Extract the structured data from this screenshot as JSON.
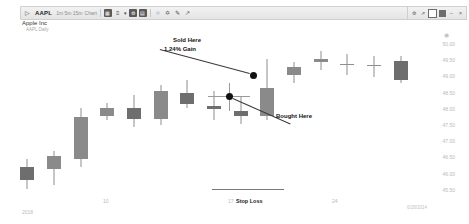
{
  "toolbar": {
    "symbol": "AAPL",
    "interval_label": "1m  5m  15m",
    "chart_type_label": "Chart",
    "caret": "▾",
    "icons": [
      {
        "name": "grid-icon",
        "glyph": "▦"
      },
      {
        "name": "indicator-icon",
        "glyph": "≡"
      },
      {
        "name": "chevron-down-icon",
        "glyph": "▾"
      },
      {
        "name": "settings-gear-icon",
        "glyph": "⚙"
      },
      {
        "name": "calendar-icon",
        "glyph": "▤"
      },
      {
        "name": "circle-tool-icon",
        "glyph": "○"
      },
      {
        "name": "trendline-tool-icon",
        "glyph": "╱"
      },
      {
        "name": "annotation-tool-icon",
        "glyph": "✐"
      },
      {
        "name": "cursor-tool-icon",
        "glyph": "↖"
      }
    ]
  },
  "window_controls": [
    {
      "name": "settings-icon",
      "glyph": "⚙"
    },
    {
      "name": "expand-icon",
      "glyph": "⤢"
    },
    {
      "name": "restore-icon",
      "glyph": "◻"
    },
    {
      "name": "maximize-icon",
      "glyph": "▣"
    },
    {
      "name": "minimize-icon",
      "glyph": "–"
    },
    {
      "name": "close-icon",
      "glyph": "×"
    }
  ],
  "header": {
    "company": "Apple Inc",
    "sub": "AAPL Daily"
  },
  "annotations": {
    "sold_line1": "Sold Here",
    "sold_line2": "1.24% Gain",
    "bought": "Bought Here",
    "stop_loss": "Stop Loss"
  },
  "footer": {
    "timestamp": "6/28/2014",
    "corner": "2018"
  },
  "chart_data": {
    "type": "candlestick",
    "title": "Apple Inc",
    "symbol": "AAPL",
    "xlabel": "",
    "ylabel": "",
    "ylim": [
      45.25,
      50.25
    ],
    "grid": false,
    "legend": "none",
    "y_ticks": [
      "50.00",
      "49.50",
      "49.00",
      "48.50",
      "48.00",
      "47.50",
      "47.00",
      "46.50",
      "46.00",
      "45.50"
    ],
    "x_ticks": [
      {
        "label": "2018",
        "x": 22
      },
      {
        "label": "10",
        "x": 103
      },
      {
        "label": "17",
        "x": 228
      },
      {
        "label": "24",
        "x": 332
      }
    ],
    "candles": [
      {
        "i": 0,
        "open": 46.1,
        "high": 46.35,
        "low": 45.45,
        "close": 45.7,
        "dir": "down"
      },
      {
        "i": 1,
        "open": 46.05,
        "high": 46.6,
        "low": 45.55,
        "close": 46.45,
        "dir": "up"
      },
      {
        "i": 2,
        "open": 46.35,
        "high": 47.95,
        "low": 46.1,
        "close": 47.65,
        "dir": "up"
      },
      {
        "i": 3,
        "open": 47.7,
        "high": 48.1,
        "low": 47.55,
        "close": 47.95,
        "dir": "up"
      },
      {
        "i": 4,
        "open": 47.95,
        "high": 48.35,
        "low": 47.35,
        "close": 47.6,
        "dir": "down"
      },
      {
        "i": 5,
        "open": 47.6,
        "high": 48.65,
        "low": 47.4,
        "close": 48.45,
        "dir": "up"
      },
      {
        "i": 6,
        "open": 48.4,
        "high": 48.8,
        "low": 47.95,
        "close": 48.05,
        "dir": "down"
      },
      {
        "i": 7,
        "open": 48.0,
        "high": 48.45,
        "low": 47.55,
        "close": 47.9,
        "dir": "down"
      },
      {
        "i": 8,
        "open": 47.85,
        "high": 48.3,
        "low": 47.45,
        "close": 47.7,
        "dir": "down"
      },
      {
        "i": 9,
        "open": 47.7,
        "high": 49.45,
        "low": 47.55,
        "close": 48.55,
        "dir": "up"
      },
      {
        "i": 10,
        "open": 48.95,
        "high": 49.35,
        "low": 48.7,
        "close": 49.2,
        "dir": "up"
      },
      {
        "i": 11,
        "open": 49.35,
        "high": 49.7,
        "low": 49.1,
        "close": 49.45,
        "dir": "up"
      },
      {
        "i": 12,
        "open": 49.3,
        "high": 49.6,
        "low": 48.95,
        "close": 49.3,
        "dir": "doji"
      },
      {
        "i": 13,
        "open": 49.25,
        "high": 49.55,
        "low": 48.9,
        "close": 49.25,
        "dir": "doji"
      },
      {
        "i": 14,
        "open": 49.4,
        "high": 49.55,
        "low": 48.7,
        "close": 48.8,
        "dir": "down"
      }
    ],
    "markers": [
      {
        "name": "bought",
        "label": "Bought Here",
        "price": 47.9,
        "x_index": 7
      },
      {
        "name": "sold",
        "label": "Sold Here",
        "price": 48.45,
        "x_index": 9,
        "gain_pct": "1.24%"
      }
    ],
    "stop_loss": {
      "label": "Stop Loss",
      "price": 45.55
    }
  }
}
